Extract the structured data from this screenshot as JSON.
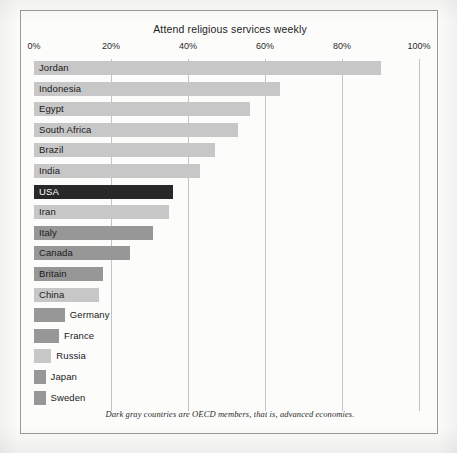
{
  "chart_data": {
    "type": "bar",
    "orientation": "horizontal",
    "title": "Attend religious services weekly",
    "xlabel": "",
    "ylabel": "",
    "xlim": [
      0,
      100
    ],
    "xticks": [
      "0%",
      "20%",
      "40%",
      "60%",
      "80%",
      "100%"
    ],
    "xtick_values": [
      0,
      20,
      40,
      60,
      80,
      100
    ],
    "grid": true,
    "legend": null,
    "footnote": "Dark gray countries are OECD members, that is, advanced economies.",
    "categories": [
      "Jordan",
      "Indonesia",
      "Egypt",
      "South Africa",
      "Brazil",
      "India",
      "USA",
      "Iran",
      "Italy",
      "Canada",
      "Britain",
      "China",
      "Germany",
      "France",
      "Russia",
      "Japan",
      "Sweden"
    ],
    "values": [
      90,
      64,
      56,
      53,
      47,
      43,
      36,
      35,
      31,
      25,
      18,
      17,
      8,
      6.5,
      4.5,
      3,
      3
    ],
    "bars": [
      {
        "label": "Jordan",
        "value": 90,
        "group": "non-oecd",
        "color": "#c7c7c7",
        "label_position": "inside"
      },
      {
        "label": "Indonesia",
        "value": 64,
        "group": "non-oecd",
        "color": "#c7c7c7",
        "label_position": "inside"
      },
      {
        "label": "Egypt",
        "value": 56,
        "group": "non-oecd",
        "color": "#c7c7c7",
        "label_position": "inside"
      },
      {
        "label": "South Africa",
        "value": 53,
        "group": "non-oecd",
        "color": "#c7c7c7",
        "label_position": "inside"
      },
      {
        "label": "Brazil",
        "value": 47,
        "group": "non-oecd",
        "color": "#c7c7c7",
        "label_position": "inside"
      },
      {
        "label": "India",
        "value": 43,
        "group": "non-oecd",
        "color": "#c7c7c7",
        "label_position": "inside"
      },
      {
        "label": "USA",
        "value": 36,
        "group": "oecd-usa",
        "color": "#282828",
        "label_position": "inside"
      },
      {
        "label": "Iran",
        "value": 35,
        "group": "non-oecd",
        "color": "#c7c7c7",
        "label_position": "inside"
      },
      {
        "label": "Italy",
        "value": 31,
        "group": "oecd",
        "color": "#979797",
        "label_position": "inside"
      },
      {
        "label": "Canada",
        "value": 25,
        "group": "oecd",
        "color": "#979797",
        "label_position": "inside"
      },
      {
        "label": "Britain",
        "value": 18,
        "group": "oecd",
        "color": "#979797",
        "label_position": "inside"
      },
      {
        "label": "China",
        "value": 17,
        "group": "non-oecd",
        "color": "#c7c7c7",
        "label_position": "inside"
      },
      {
        "label": "Germany",
        "value": 8,
        "group": "oecd",
        "color": "#979797",
        "label_position": "outside"
      },
      {
        "label": "France",
        "value": 6.5,
        "group": "oecd",
        "color": "#979797",
        "label_position": "outside"
      },
      {
        "label": "Russia",
        "value": 4.5,
        "group": "non-oecd",
        "color": "#c7c7c7",
        "label_position": "outside"
      },
      {
        "label": "Japan",
        "value": 3,
        "group": "oecd",
        "color": "#979797",
        "label_position": "outside"
      },
      {
        "label": "Sweden",
        "value": 3,
        "group": "oecd",
        "color": "#979797",
        "label_position": "outside"
      }
    ],
    "colors": {
      "non_oecd_bar": "#c7c7c7",
      "oecd_bar": "#979797",
      "highlight_bar": "#282828",
      "gridline": "#c3c3c3",
      "frame": "#9b9b9b",
      "background": "#fcfcfb",
      "text": "#1a1a1a"
    }
  }
}
